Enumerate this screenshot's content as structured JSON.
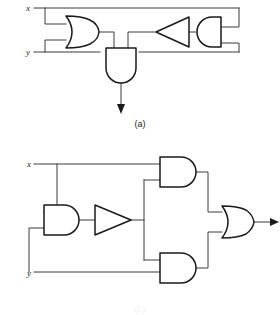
{
  "figure": {
    "background_color": "#ffffff",
    "wire_color": "#3a3a3a",
    "gate_stroke_color": "#1a1a1a",
    "gate_fill_color": "#ffffff",
    "width": 280,
    "height": 315
  },
  "circuit_a": {
    "caption": "(a)",
    "inputs": [
      {
        "label": "x",
        "x": 31,
        "y": 11
      },
      {
        "label": "y",
        "x": 31,
        "y": 52
      }
    ],
    "gates": [
      {
        "name": "or-gate-1",
        "type": "OR",
        "orientation": "right",
        "inputs": 2
      },
      {
        "name": "not-gate-1",
        "type": "NOT",
        "orientation": "left",
        "inputs": 1
      },
      {
        "name": "and-gate-1",
        "type": "AND",
        "orientation": "left",
        "inputs": 2
      },
      {
        "name": "and-gate-2",
        "type": "AND",
        "orientation": "down",
        "inputs": 2
      }
    ],
    "output": {
      "type": "arrow",
      "direction": "down"
    }
  },
  "circuit_b": {
    "caption": "(b)",
    "inputs": [
      {
        "label": "x",
        "x": 32,
        "y": 167
      },
      {
        "label": "y",
        "x": 32,
        "y": 276
      }
    ],
    "gates": [
      {
        "name": "and-gate-left",
        "type": "AND",
        "orientation": "right",
        "inputs": 2
      },
      {
        "name": "not-gate",
        "type": "NOT",
        "orientation": "right",
        "inputs": 1
      },
      {
        "name": "and-gate-top",
        "type": "AND",
        "orientation": "right",
        "inputs": 2
      },
      {
        "name": "and-gate-bottom",
        "type": "AND",
        "orientation": "right",
        "inputs": 2
      },
      {
        "name": "or-gate-out",
        "type": "OR",
        "orientation": "right",
        "inputs": 2
      }
    ],
    "output": {
      "type": "arrow",
      "direction": "right"
    }
  }
}
